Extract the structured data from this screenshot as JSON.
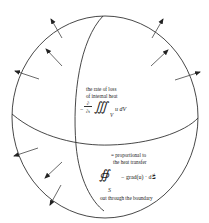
{
  "diagram": {
    "type": "sphere-heat-flux",
    "colors": {
      "stroke": "#333333",
      "background": "#ffffff",
      "text": "#222222"
    },
    "volume_annotation": {
      "line1": "the rate of loss",
      "line2": "of internal heat",
      "minus": "−",
      "frac_num": "∂",
      "frac_den": "∂t",
      "integral": "∭",
      "subscript": "V",
      "integrand": "u dV"
    },
    "surface_annotation": {
      "line1": "= proportional to",
      "line2": "the heat transfer",
      "integral": "∯",
      "subscript": "S",
      "integrand": "− grad(u) · dS⃗",
      "line3": "out through the boundary"
    },
    "arrows": {
      "count": 9,
      "direction": "outward-normal"
    }
  }
}
